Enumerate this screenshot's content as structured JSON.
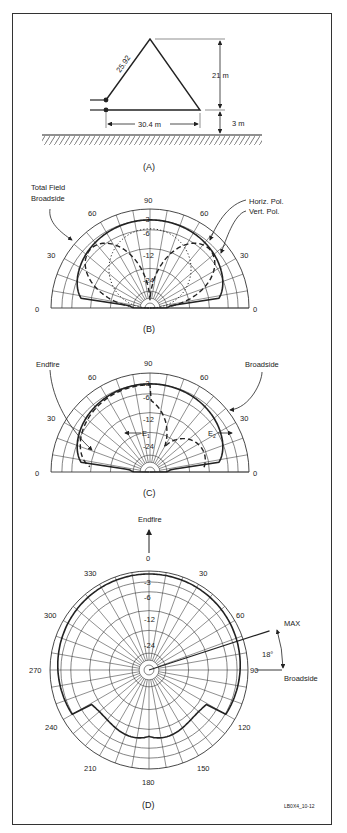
{
  "figure_id": "LB0X4_10-12",
  "panels": {
    "A": {
      "caption": "(A)",
      "side_label": "25.92",
      "height_label": "21 m",
      "base_label": "30.4 m",
      "ground_height_label": "3 m"
    },
    "B": {
      "caption": "(B)",
      "angle_labels": [
        "0",
        "30",
        "60",
        "90",
        "60",
        "30",
        "0"
      ],
      "db_labels": [
        "-3",
        "-6",
        "-12",
        "-24"
      ],
      "legend": {
        "total": "Total Field",
        "total2": "Broadside",
        "horiz": "Horiz. Pol.",
        "vert": "Vert. Pol."
      }
    },
    "C": {
      "caption": "(C)",
      "angle_labels": [
        "0",
        "30",
        "60",
        "90",
        "60",
        "30",
        "0"
      ],
      "db_labels": [
        "-3",
        "-6",
        "-12",
        "-24"
      ],
      "legend": {
        "endfire": "Endfire",
        "broadside": "Broadside",
        "e1": "E",
        "e1_sub": "1",
        "e2": "E",
        "e2_sub": "2"
      }
    },
    "D": {
      "caption": "(D)",
      "endfire_label": "Endfire",
      "broadside_label": "Broadside",
      "max_label": "MAX",
      "max_angle_label": "18°",
      "angle_labels": {
        "a0": "0",
        "a30": "30",
        "a60": "60",
        "a90": "90",
        "a120": "120",
        "a150": "150",
        "a180": "180",
        "a210": "210",
        "a240": "240",
        "a270": "270",
        "a300": "300",
        "a330": "330"
      },
      "db_labels": [
        "-3",
        "-6",
        "-12",
        "-24"
      ]
    }
  },
  "colors": {
    "line": "#222222",
    "grid": "#333333",
    "frame": "#333333"
  }
}
